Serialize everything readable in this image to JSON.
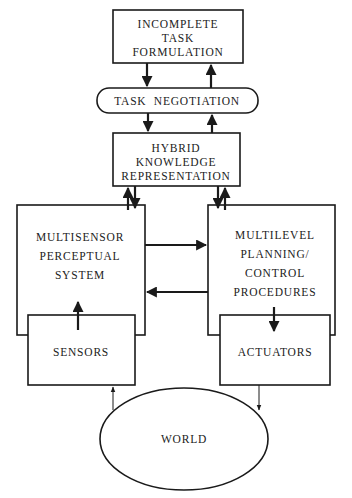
{
  "diagram": {
    "colors": {
      "stroke": "#1a1a1a",
      "text": "#222222",
      "background": "#ffffff"
    },
    "nodes": {
      "incomplete_task": {
        "lines": [
          "INCOMPLETE",
          "TASK",
          "FORMULATION"
        ]
      },
      "task_negotiation": {
        "lines": [
          "TASK  NEGOTIATION"
        ]
      },
      "hybrid_knowledge": {
        "lines": [
          "HYBRID",
          "KNOWLEDGE",
          "REPRESENTATION"
        ]
      },
      "multisensor": {
        "lines": [
          "MULTISENSOR",
          "PERCEPTUAL",
          "SYSTEM"
        ]
      },
      "multilevel": {
        "lines": [
          "MULTILEVEL",
          "PLANNING/",
          "CONTROL",
          "PROCEDURES"
        ]
      },
      "sensors": {
        "lines": [
          "SENSORS"
        ]
      },
      "actuators": {
        "lines": [
          "ACTUATORS"
        ]
      },
      "world": {
        "lines": [
          "WORLD"
        ]
      }
    },
    "edges": [
      {
        "from": "incomplete_task",
        "to": "task_negotiation"
      },
      {
        "from": "task_negotiation",
        "to": "incomplete_task"
      },
      {
        "from": "task_negotiation",
        "to": "hybrid_knowledge"
      },
      {
        "from": "hybrid_knowledge",
        "to": "task_negotiation"
      },
      {
        "from": "hybrid_knowledge",
        "to": "multisensor"
      },
      {
        "from": "multisensor",
        "to": "hybrid_knowledge"
      },
      {
        "from": "hybrid_knowledge",
        "to": "multilevel"
      },
      {
        "from": "multilevel",
        "to": "hybrid_knowledge"
      },
      {
        "from": "multisensor",
        "to": "multilevel"
      },
      {
        "from": "multilevel",
        "to": "multisensor"
      },
      {
        "from": "sensors",
        "to": "multisensor"
      },
      {
        "from": "multilevel",
        "to": "actuators"
      },
      {
        "from": "world",
        "to": "sensors"
      },
      {
        "from": "actuators",
        "to": "world"
      }
    ]
  }
}
